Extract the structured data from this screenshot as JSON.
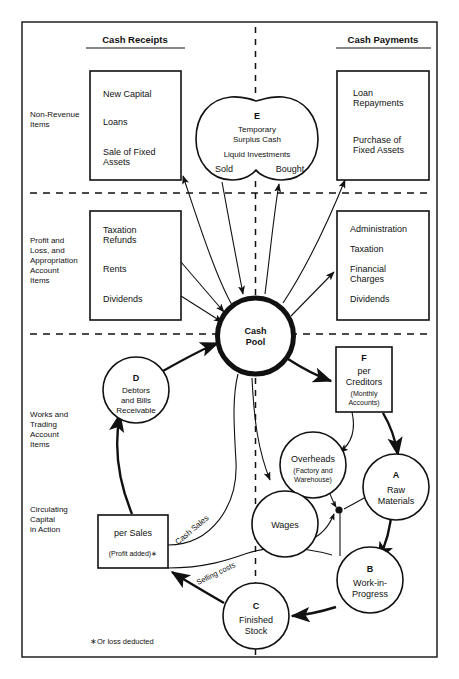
{
  "headers": {
    "left": "Cash Receipts",
    "right": "Cash Payments"
  },
  "row_labels": [
    "Non-Revenue\nItems",
    "Profit and\nLoss, and\nAppropriation\nAccount\nItems",
    "Works and\nTrading\nAccount\nItems",
    "Circulating\nCapital\nin Action"
  ],
  "row_labels_lines": {
    "non_revenue": [
      "Non-Revenue",
      "Items"
    ],
    "profit_loss": [
      "Profit and",
      "Loss, and",
      "Appropriation",
      "Account",
      "Items"
    ],
    "works_trading": [
      "Works and",
      "Trading",
      "Account",
      "Items"
    ],
    "circulating": [
      "Circulating",
      "Capital",
      "in Action"
    ]
  },
  "boxes": {
    "receipts_non_revenue": [
      "New Capital",
      "Loans",
      "Sale of Fixed",
      "Assets"
    ],
    "payments_non_revenue": [
      "Loan",
      "Repayments",
      "Purchase of",
      "Fixed Assets"
    ],
    "receipts_profit_loss": [
      "Taxation",
      "Refunds",
      "Rents",
      "Dividends"
    ],
    "payments_profit_loss": [
      "Administration",
      "Taxation",
      "Financial",
      "Charges",
      "Dividends"
    ],
    "per_sales": [
      "per Sales",
      "(Profit added)∗"
    ],
    "creditors": [
      "F",
      "per",
      "Creditors",
      "(Monthly",
      "Accounts)"
    ]
  },
  "nodes": {
    "temporary_surplus": {
      "letter": "E",
      "line1": "Temporary",
      "line2": "Surplus Cash",
      "line3": "Liquid Investments",
      "left_label": "Sold",
      "right_label": "Bought"
    },
    "cash_pool": {
      "line1": "Cash",
      "line2": "Pool"
    },
    "debtors": {
      "letter": "D",
      "line1": "Debtors",
      "line2": "and Bills",
      "line3": "Receivable"
    },
    "overheads": {
      "line1": "Overheads",
      "line2": "(Factory and",
      "line3": "Warehouse)"
    },
    "raw_materials": {
      "letter": "A",
      "line1": "Raw",
      "line2": "Materials"
    },
    "wages": {
      "line1": "Wages"
    },
    "work_in_progress": {
      "letter": "B",
      "line1": "Work-in-",
      "line2": "Progress"
    },
    "finished_stock": {
      "letter": "C",
      "line1": "Finished",
      "line2": "Stock"
    }
  },
  "edge_labels": {
    "cash_sales": "Cash Sales",
    "selling_costs": "Selling costs"
  },
  "footnote": "∗Or loss deducted",
  "colors": {
    "ink": "#111111",
    "paper": "#ffffff"
  }
}
